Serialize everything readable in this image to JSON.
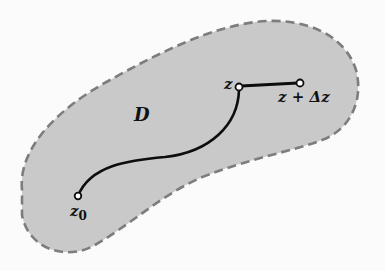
{
  "diagram": {
    "region": {
      "label": "D",
      "fill": "#c9c9c9",
      "border_color": "#7a7a7a",
      "border_style": "dashed"
    },
    "path": {
      "color": "#0d0d0d",
      "start_label": "z",
      "start_subscript": "0",
      "end_label": "z"
    },
    "increment": {
      "label": "z + Δz"
    }
  }
}
